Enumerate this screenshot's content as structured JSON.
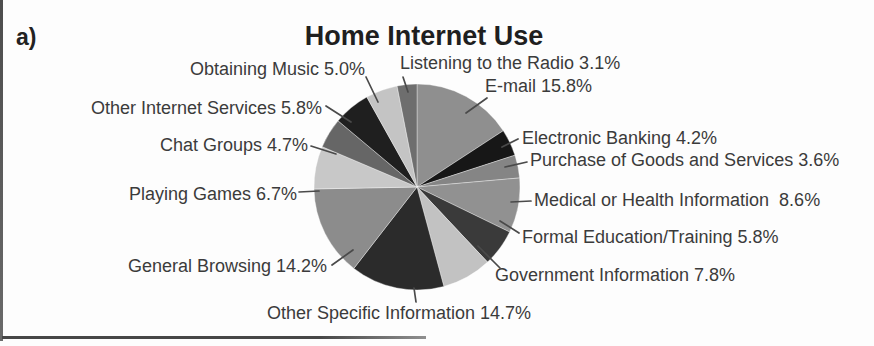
{
  "figure_label": "a)",
  "title": "Home Internet Use",
  "colors_note": {
    "background": "#fdfdfd",
    "text": "#3b3b3b",
    "leader_line": "#4a4a4a"
  },
  "chart_data": {
    "type": "pie",
    "title": "Home Internet Use",
    "start_angle_deg": 0,
    "direction": "clockwise",
    "legend": "none",
    "categories": [
      "E-mail",
      "Electronic Banking",
      "Purchase of Goods and Services",
      "Medical or Health Information",
      "Formal Education/Training",
      "Government Information",
      "Other Specific Information",
      "General Browsing",
      "Playing Games",
      "Chat Groups",
      "Other Internet Services",
      "Obtaining Music",
      "Listening to the Radio"
    ],
    "values": [
      15.8,
      4.2,
      3.6,
      8.6,
      5.8,
      7.8,
      14.7,
      14.2,
      6.7,
      4.7,
      5.8,
      5.0,
      3.1
    ],
    "colors": [
      "#8f8f8f",
      "#171717",
      "#858585",
      "#919191",
      "#3a3a3a",
      "#c2c2c2",
      "#2b2b2b",
      "#8c8c8c",
      "#c8c8c8",
      "#666666",
      "#1f1f1f",
      "#c4c4c4",
      "#6e6e6e"
    ],
    "labels_display": [
      "E-mail 15.8%",
      "Electronic Banking 4.2%",
      "Purchase of Goods and Services 3.6%",
      "Medical or Health Information  8.6%",
      "Formal Education/Training 5.8%",
      "Government Information 7.8%",
      "Other Specific Information 14.7%",
      "General Browsing 14.2%",
      "Playing Games 6.7%",
      "Chat Groups 4.7%",
      "Other Internet Services 5.8%",
      "Obtaining Music 5.0%",
      "Listening to the Radio 3.1%"
    ]
  }
}
